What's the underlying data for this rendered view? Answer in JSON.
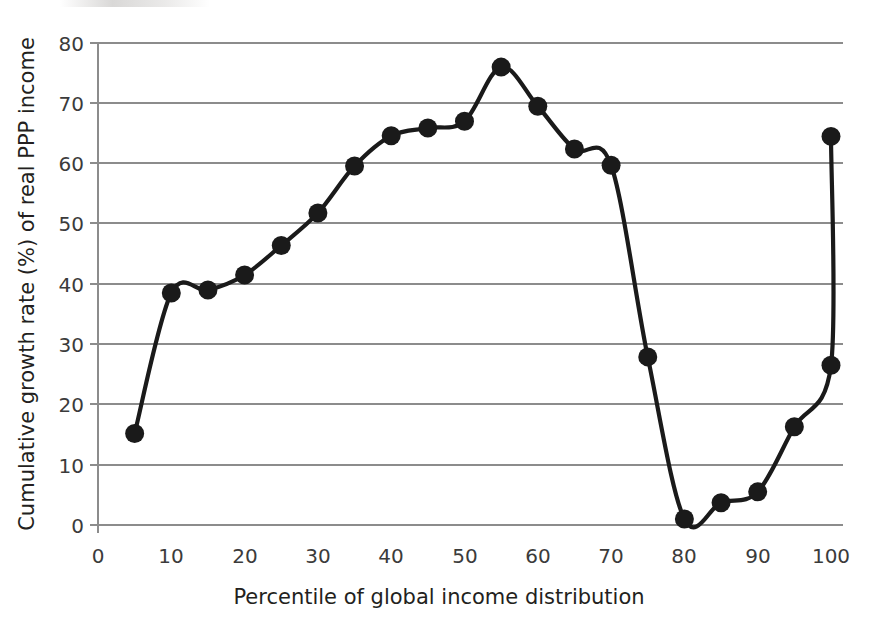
{
  "chart_data": {
    "type": "line",
    "title": "",
    "subtitle": "",
    "xlabel": "Percentile of global income distribution",
    "ylabel": "Cumulative growth rate (%) of real PPP income",
    "xlim": [
      0,
      100
    ],
    "ylim": [
      0,
      80
    ],
    "xticks": [
      0,
      10,
      20,
      30,
      40,
      50,
      60,
      70,
      80,
      90,
      100
    ],
    "xtick_labels": [
      "0",
      "10",
      "20",
      "30",
      "40",
      "50",
      "60",
      "70",
      "80",
      "90",
      "100"
    ],
    "yticks": [
      0,
      10,
      20,
      30,
      40,
      50,
      60,
      70,
      80
    ],
    "ytick_labels": [
      "0",
      "10",
      "20",
      "30",
      "40",
      "50",
      "60",
      "70",
      "80"
    ],
    "grid": "horizontal",
    "legend": "none",
    "marker": "filled-circle",
    "line_color": "#1a1a1a",
    "grid_color": "#8c8c8c",
    "x": [
      5,
      10,
      15,
      20,
      25,
      30,
      35,
      40,
      45,
      50,
      55,
      60,
      65,
      70,
      75,
      80,
      85,
      90,
      95,
      100,
      100
    ],
    "values": [
      15.2,
      38.5,
      39.0,
      41.5,
      46.4,
      51.8,
      59.6,
      64.6,
      65.9,
      67.0,
      76.0,
      69.5,
      62.4,
      59.7,
      27.9,
      1.0,
      3.7,
      5.5,
      16.3,
      26.5,
      64.5
    ],
    "series": [
      {
        "name": "Cumulative real PPP income growth",
        "points": [
          {
            "x": 5,
            "y": 15.2
          },
          {
            "x": 10,
            "y": 38.5
          },
          {
            "x": 15,
            "y": 39.0
          },
          {
            "x": 20,
            "y": 41.5
          },
          {
            "x": 25,
            "y": 46.4
          },
          {
            "x": 30,
            "y": 51.8
          },
          {
            "x": 35,
            "y": 59.6
          },
          {
            "x": 40,
            "y": 64.6
          },
          {
            "x": 45,
            "y": 65.9
          },
          {
            "x": 50,
            "y": 67.0
          },
          {
            "x": 55,
            "y": 76.0
          },
          {
            "x": 60,
            "y": 69.5
          },
          {
            "x": 65,
            "y": 62.4
          },
          {
            "x": 70,
            "y": 59.7
          },
          {
            "x": 75,
            "y": 27.9
          },
          {
            "x": 80,
            "y": 1.0
          },
          {
            "x": 85,
            "y": 3.7
          },
          {
            "x": 90,
            "y": 5.5
          },
          {
            "x": 95,
            "y": 16.3
          },
          {
            "x": 100,
            "y": 26.5
          },
          {
            "x": 100,
            "y": 64.5
          }
        ]
      }
    ],
    "annotations": []
  }
}
